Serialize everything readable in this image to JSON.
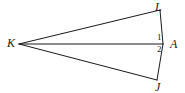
{
  "figure": {
    "background_color": "#ffffff",
    "stroke_color": "#1a1a1a",
    "stroke_width": 1,
    "width": 185,
    "height": 93,
    "vertices": [
      {
        "name": "K",
        "label": "K",
        "x": 19,
        "y": 44,
        "label_x": 7,
        "label_y": 37
      },
      {
        "name": "L",
        "label": "L",
        "x": 160,
        "y": 10,
        "label_x": 155,
        "label_y": 1
      },
      {
        "name": "A",
        "label": "A",
        "x": 163,
        "y": 44,
        "label_x": 170,
        "label_y": 38
      },
      {
        "name": "J",
        "label": "J",
        "x": 157,
        "y": 80,
        "label_x": 155,
        "label_y": 81
      }
    ],
    "segments": [
      {
        "name": "segment-KL",
        "from": "K",
        "to": "L",
        "x1": 19,
        "y1": 44,
        "x2": 160,
        "y2": 10
      },
      {
        "name": "segment-KA",
        "from": "K",
        "to": "A",
        "x1": 19,
        "y1": 44,
        "x2": 163,
        "y2": 44
      },
      {
        "name": "segment-KJ",
        "from": "K",
        "to": "J",
        "x1": 19,
        "y1": 44,
        "x2": 157,
        "y2": 80
      },
      {
        "name": "segment-LA",
        "from": "L",
        "to": "A",
        "x1": 160,
        "y1": 10,
        "x2": 163,
        "y2": 44
      },
      {
        "name": "segment-AJ",
        "from": "A",
        "to": "J",
        "x1": 163,
        "y1": 44,
        "x2": 157,
        "y2": 80
      }
    ],
    "angle_marks": [
      {
        "name": "angle-1",
        "label": "1",
        "x": 157,
        "y": 33
      },
      {
        "name": "angle-2",
        "label": "2",
        "x": 157,
        "y": 45
      }
    ]
  }
}
